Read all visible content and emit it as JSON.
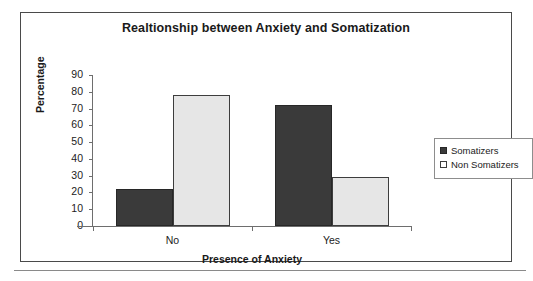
{
  "chart_data": {
    "type": "bar",
    "title": "Realtionship between Anxiety and Somatization",
    "xlabel": "Presence of Anxiety",
    "ylabel": "Percentage",
    "categories": [
      "No",
      "Yes"
    ],
    "series": [
      {
        "name": "Somatizers",
        "values": [
          22,
          72
        ],
        "color": "#3a3a3a"
      },
      {
        "name": "Non Somatizers",
        "values": [
          78,
          29
        ],
        "color": "#e6e6e6"
      }
    ],
    "ylim": [
      0,
      90
    ],
    "ytick_step": 10,
    "yticks": [
      90,
      80,
      70,
      60,
      50,
      40,
      30,
      20,
      10,
      0
    ],
    "ytick_labels": [
      "90",
      "80",
      "70",
      "60",
      "50",
      "40",
      "30",
      "20",
      "10",
      "0"
    ],
    "grid": false,
    "legend_position": "right-outside",
    "bar_gap": "none"
  },
  "legend": {
    "items": [
      {
        "label": "Somatizers"
      },
      {
        "label": "Non Somatizers"
      }
    ]
  },
  "frame": {
    "border_color": "#4a4a4a",
    "background": "#ffffff"
  }
}
